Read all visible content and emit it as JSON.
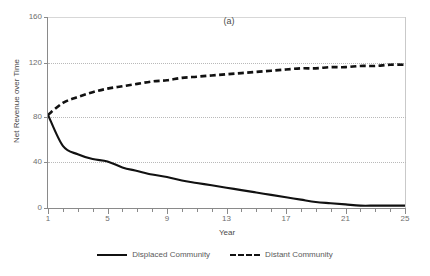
{
  "chart_data": {
    "type": "line",
    "title": "",
    "panel_label": "(a)",
    "xlabel": "Year",
    "ylabel": "Net Revenue over Time",
    "xlim": [
      1,
      25
    ],
    "ylim": [
      0,
      160
    ],
    "yticks": [
      0,
      40,
      80,
      120,
      160
    ],
    "xticks": [
      1,
      5,
      9,
      13,
      17,
      21,
      25
    ],
    "x_minor_tick_step": 1,
    "grid": "horizontal-dotted at 40, 80, 120",
    "legend_position": "bottom-center",
    "x": [
      1,
      2,
      3,
      4,
      5,
      6,
      7,
      8,
      9,
      10,
      11,
      12,
      13,
      14,
      15,
      16,
      17,
      18,
      19,
      20,
      21,
      22,
      23,
      24,
      25
    ],
    "series": [
      {
        "name": "Displaced Community",
        "style": "solid",
        "color": "#111111",
        "values": [
          78,
          52,
          45,
          41,
          39,
          34,
          31,
          28,
          26,
          23,
          21,
          19,
          17,
          15,
          13,
          11,
          9,
          7,
          5,
          4,
          3,
          2,
          2,
          2,
          2
        ]
      },
      {
        "name": "Distant Community",
        "style": "dashed",
        "color": "#111111",
        "values": [
          78,
          88,
          93,
          97,
          100,
          102,
          104,
          106,
          107,
          109,
          110,
          111,
          112,
          113,
          114,
          115,
          116,
          117,
          117,
          118,
          118,
          119,
          119,
          120,
          120
        ]
      }
    ]
  },
  "axis": {
    "y_tick_labels": [
      "0",
      "40",
      "80",
      "120",
      "160"
    ],
    "x_tick_labels": [
      "1",
      "5",
      "9",
      "13",
      "17",
      "21",
      "25"
    ],
    "y_title": "Net Revenue over Time",
    "x_title": "Year"
  },
  "panel": {
    "label": "(a)"
  },
  "legend": {
    "items": [
      {
        "label": "Displaced Community",
        "style": "solid"
      },
      {
        "label": "Distant Community",
        "style": "dashed"
      }
    ]
  }
}
